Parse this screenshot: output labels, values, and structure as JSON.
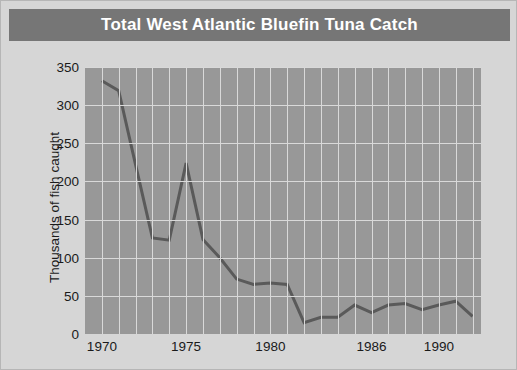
{
  "header": {
    "title": "Total West Atlantic Bluefin Tuna Catch"
  },
  "axes": {
    "y_title": "Thousands of fish caught",
    "y_ticks": [
      "0",
      "50",
      "100",
      "150",
      "200",
      "250",
      "300",
      "350"
    ],
    "x_ticks": [
      "1970",
      "1975",
      "1980",
      "1986",
      "1990"
    ]
  },
  "chart_data": {
    "type": "line",
    "title": "Total West Atlantic Bluefin Tuna Catch",
    "xlabel": "",
    "ylabel": "Thousands of fish caught",
    "xlim": [
      1969,
      1992.5
    ],
    "ylim": [
      0,
      350
    ],
    "xtick_values": [
      1970,
      1975,
      1980,
      1986,
      1990
    ],
    "xtick_labels": [
      "1970",
      "1975",
      "1980",
      "1986",
      "1990"
    ],
    "ytick_values": [
      0,
      50,
      100,
      150,
      200,
      250,
      300,
      350
    ],
    "ytick_labels": [
      "0",
      "50",
      "100",
      "150",
      "200",
      "250",
      "300",
      "350"
    ],
    "grid": true,
    "grid_color": "#d9d9d9",
    "plot_bg": "#989898",
    "figure_bg": "#d6d6d6",
    "line_color": "#5a5a5a",
    "line_width": 3,
    "legend": null,
    "x": [
      1970,
      1971,
      1972,
      1973,
      1974,
      1975,
      1976,
      1977,
      1978,
      1979,
      1980,
      1981,
      1982,
      1983,
      1984,
      1985,
      1986,
      1987,
      1988,
      1989,
      1990,
      1991,
      1992
    ],
    "values": [
      332,
      319,
      222,
      126,
      123,
      224,
      124,
      100,
      72,
      65,
      67,
      65,
      15,
      22,
      22,
      38,
      28,
      38,
      40,
      32,
      38,
      43,
      23
    ],
    "series": [
      {
        "name": "West Atlantic bluefin tuna catch",
        "values": [
          332,
          319,
          222,
          126,
          123,
          224,
          124,
          100,
          72,
          65,
          67,
          65,
          15,
          22,
          22,
          38,
          28,
          38,
          40,
          32,
          38,
          43,
          23
        ]
      }
    ]
  },
  "colors": {
    "title_bar": "#767676",
    "title_text": "#ffffff",
    "plot_background": "#989898",
    "grid": "#d9d9d9",
    "line": "#5a5a5a",
    "figure_background": "#d6d6d6"
  }
}
